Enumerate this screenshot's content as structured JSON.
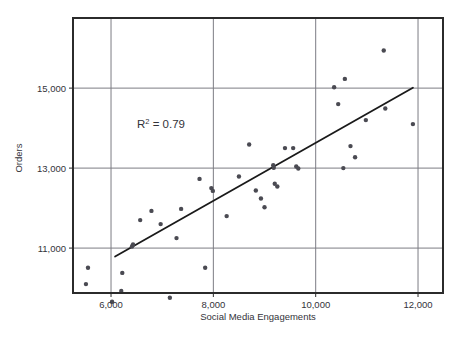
{
  "chart_data": {
    "type": "scatter",
    "title": "",
    "xlabel": "Social Media Engagements",
    "ylabel": "Orders",
    "xlim": [
      5257,
      12488
    ],
    "ylim": [
      9877,
      16753
    ],
    "xticks": [
      6000,
      8000,
      10000,
      12000
    ],
    "xtick_labels": [
      "6,000",
      "8,000",
      "10,000",
      "12,000"
    ],
    "yticks": [
      11000,
      13000,
      15000
    ],
    "ytick_labels": [
      "11,000",
      "13,000",
      "15,000"
    ],
    "grid": true,
    "legend": "none",
    "annotations": [
      {
        "name": "r-squared",
        "text": "R2 = 0.79",
        "base": "R",
        "sup": "2",
        "rest": " = 0.79",
        "x": 6800,
        "y": 14050
      }
    ],
    "series": [
      {
        "name": "Orders vs Social Media Engagements",
        "marker": "circle",
        "color": "#4a4a52",
        "points": [
          [
            5550,
            10510
          ],
          [
            5510,
            10100
          ],
          [
            6020,
            9660
          ],
          [
            6220,
            10380
          ],
          [
            6200,
            9930
          ],
          [
            6410,
            11040
          ],
          [
            6430,
            11090
          ],
          [
            6570,
            11700
          ],
          [
            6790,
            11930
          ],
          [
            6970,
            11600
          ],
          [
            7150,
            9760
          ],
          [
            7280,
            11250
          ],
          [
            7370,
            11980
          ],
          [
            7730,
            12730
          ],
          [
            7840,
            10510
          ],
          [
            7960,
            12500
          ],
          [
            7990,
            12430
          ],
          [
            8260,
            11800
          ],
          [
            8500,
            12790
          ],
          [
            8700,
            13590
          ],
          [
            8830,
            12440
          ],
          [
            8930,
            12240
          ],
          [
            9000,
            12020
          ],
          [
            9170,
            13070
          ],
          [
            9180,
            13010
          ],
          [
            9200,
            12610
          ],
          [
            9250,
            12540
          ],
          [
            9400,
            13500
          ],
          [
            9560,
            13500
          ],
          [
            9620,
            13040
          ],
          [
            9660,
            12990
          ],
          [
            10360,
            15020
          ],
          [
            10440,
            14600
          ],
          [
            10540,
            13000
          ],
          [
            10570,
            15230
          ],
          [
            10680,
            13550
          ],
          [
            10770,
            13270
          ],
          [
            10980,
            14200
          ],
          [
            11330,
            15940
          ],
          [
            11360,
            14490
          ],
          [
            11900,
            14100
          ]
        ]
      }
    ],
    "trendline": {
      "name": "linear-fit",
      "color": "#1a1a1a",
      "x_start": 6080,
      "y_start": 10790,
      "x_end": 11900,
      "y_end": 15010
    }
  },
  "style": {
    "frame_color": "#2b2b2b",
    "grid_color": "#7c7c84",
    "text_color": "#33333a",
    "background": "#ffffff"
  }
}
